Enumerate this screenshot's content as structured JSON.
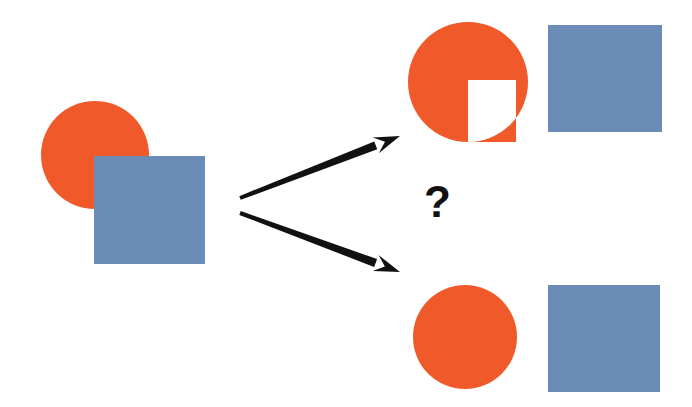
{
  "figure": {
    "background_color": "#ffffff",
    "width": 692,
    "height": 407,
    "question_mark": "?"
  },
  "palette": {
    "orange": "#F05A2A",
    "blue": "#6C8CB8",
    "arrow_black": "#111111",
    "question_mark_color": "#111111"
  },
  "stimulus": {
    "label": "Occluded stimulus",
    "circle": {
      "label": "Orange circle (partially occluded)",
      "cx": 95,
      "cy": 155,
      "r": 54,
      "color": "#F05A2A"
    },
    "square": {
      "label": "Blue square (occluder)",
      "x": 94,
      "y": 156,
      "width": 111,
      "height": 108,
      "color": "#6C8CB8"
    }
  },
  "arrows": [
    {
      "name": "arrow-to-top-interpretation",
      "x1": 240,
      "y1": 198,
      "x2": 400,
      "y2": 136,
      "color": "#111111"
    },
    {
      "name": "arrow-to-bottom-interpretation",
      "x1": 240,
      "y1": 213,
      "x2": 400,
      "y2": 272,
      "color": "#111111"
    }
  ],
  "interpretations": [
    {
      "name": "notched-circle-interpretation",
      "label": "Interpretation A: notched circle plus square",
      "shape_orange": {
        "type": "circle-with-square-notch",
        "cx": 468,
        "cy": 82,
        "r": 60,
        "notch_x": 468,
        "notch_y": 80,
        "notch_width": 48,
        "notch_height": 62,
        "color": "#F05A2A"
      },
      "shape_blue": {
        "type": "square",
        "x": 548,
        "y": 25,
        "width": 114,
        "height": 107,
        "color": "#6C8CB8"
      }
    },
    {
      "name": "complete-circle-interpretation",
      "label": "Interpretation B: complete circle plus square",
      "shape_orange": {
        "type": "circle",
        "cx": 465,
        "cy": 337,
        "r": 52,
        "color": "#F05A2A"
      },
      "shape_blue": {
        "type": "square",
        "x": 548,
        "y": 285,
        "width": 112,
        "height": 107,
        "color": "#6C8CB8"
      }
    }
  ]
}
